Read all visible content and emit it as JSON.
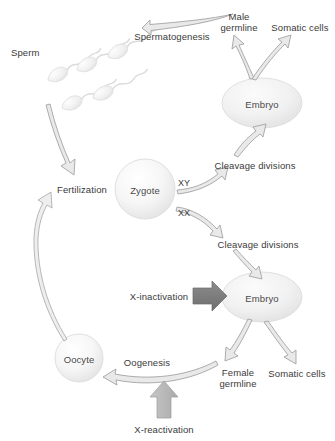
{
  "figure": {
    "type": "diagram",
    "background_color": "#ffffff",
    "text_color": "#3a3a3a"
  },
  "nodes": {
    "sperm": {
      "label": "Sperm",
      "x": 33,
      "y": 52,
      "kind": "cell-cluster"
    },
    "zygote": {
      "label": "Zygote",
      "x": 145,
      "y": 189,
      "kind": "sphere",
      "rx": 30,
      "ry": 30
    },
    "oocyte": {
      "label": "Oocyte",
      "x": 79,
      "y": 358,
      "kind": "sphere",
      "rx": 24,
      "ry": 24
    },
    "embryo_top": {
      "label": "Embryo",
      "x": 262,
      "y": 103,
      "kind": "ellipse",
      "rx": 40,
      "ry": 25
    },
    "embryo_bottom": {
      "label": "Embryo",
      "x": 262,
      "y": 297,
      "kind": "ellipse",
      "rx": 40,
      "ry": 25
    }
  },
  "labels": {
    "spermatogenesis": "Spermatogenesis",
    "male_germline_line1": "Male",
    "male_germline_line2": "germline",
    "somatic_cells_top": "Somatic cells",
    "fertilization": "Fertilization",
    "cleavage_divisions_top": "Cleavage divisions",
    "cleavage_divisions_bottom": "Cleavage divisions",
    "karyotype_xy": "XY",
    "karyotype_xx": "XX",
    "x_inactivation": "X-inactivation",
    "x_reactivation": "X-reactivation",
    "female_germline_line1": "Female",
    "female_germline_line2": "germline",
    "somatic_cells_bottom": "Somatic cells",
    "oogenesis": "Oogenesis"
  },
  "colors": {
    "cell_fill_light": "#f2f2f2",
    "cell_stroke": "#d8d8d8",
    "arrow_outline_stroke": "#9a9a9a",
    "arrow_outline_fill": "#e8e8e8",
    "block_arrow_dark": "#7c7c7c",
    "block_arrow_light": "#b8b8b8",
    "sperm_fill": "#efefef",
    "text": "#3a3a3a"
  },
  "sperm_cells": [
    {
      "x": 48,
      "y": 80,
      "rot": -28
    },
    {
      "x": 77,
      "y": 70,
      "rot": -28
    },
    {
      "x": 108,
      "y": 57,
      "rot": -28
    },
    {
      "x": 62,
      "y": 108,
      "rot": -25
    },
    {
      "x": 93,
      "y": 98,
      "rot": -25
    }
  ],
  "edges": [
    {
      "from": "male_germline",
      "to": "sperm",
      "label": "Spermatogenesis",
      "style": "curved-outline-arrow"
    },
    {
      "from": "embryo_top",
      "to": "male_germline",
      "label": "",
      "style": "curved-outline-arrow"
    },
    {
      "from": "embryo_top",
      "to": "somatic_cells_top",
      "label": "",
      "style": "curved-outline-arrow"
    },
    {
      "from": "sperm",
      "to": "fertilization",
      "label": "",
      "style": "curved-outline-arrow"
    },
    {
      "from": "oocyte",
      "to": "fertilization",
      "label": "",
      "style": "curved-outline-arrow"
    },
    {
      "from": "fertilization",
      "to": "zygote",
      "label": "",
      "style": "implicit"
    },
    {
      "from": "zygote",
      "to": "cleavage_divisions_top",
      "label": "XY",
      "style": "curved-outline-arrow"
    },
    {
      "from": "cleavage_divisions_top",
      "to": "embryo_top",
      "label": "",
      "style": "curved-outline-arrow"
    },
    {
      "from": "zygote",
      "to": "cleavage_divisions_bottom",
      "label": "XX",
      "style": "curved-outline-arrow"
    },
    {
      "from": "cleavage_divisions_bottom",
      "to": "embryo_bottom",
      "label": "",
      "style": "curved-outline-arrow"
    },
    {
      "from": "x_inactivation",
      "to": "embryo_bottom",
      "label": "X-inactivation",
      "style": "block-arrow-dark"
    },
    {
      "from": "embryo_bottom",
      "to": "female_germline",
      "label": "",
      "style": "curved-outline-arrow"
    },
    {
      "from": "embryo_bottom",
      "to": "somatic_cells_bottom",
      "label": "",
      "style": "curved-outline-arrow"
    },
    {
      "from": "female_germline",
      "to": "oocyte",
      "label": "Oogenesis",
      "style": "curved-outline-arrow"
    },
    {
      "from": "x_reactivation",
      "to": "oogenesis_arrow",
      "label": "X-reactivation",
      "style": "block-arrow-light"
    }
  ]
}
